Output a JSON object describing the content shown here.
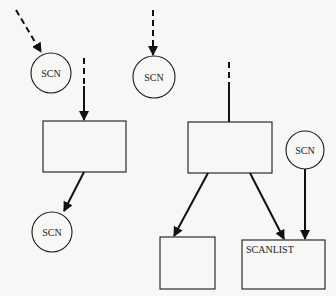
{
  "diagram": {
    "nodes": [
      {
        "id": "scn1",
        "type": "circle",
        "label": "SCN",
        "cx": 51,
        "cy": 73,
        "r": 20
      },
      {
        "id": "scn2",
        "type": "circle",
        "label": "SCN",
        "cx": 154,
        "cy": 77,
        "r": 21
      },
      {
        "id": "box1",
        "type": "rect",
        "label": "",
        "x": 43,
        "y": 121,
        "w": 83,
        "h": 51
      },
      {
        "id": "scn4",
        "type": "circle",
        "label": "SCN",
        "cx": 52,
        "cy": 232,
        "r": 20
      },
      {
        "id": "box2",
        "type": "rect",
        "label": "",
        "x": 188,
        "y": 122,
        "w": 84,
        "h": 51
      },
      {
        "id": "scn3",
        "type": "circle",
        "label": "SCN",
        "cx": 305,
        "cy": 150,
        "r": 19
      },
      {
        "id": "box3",
        "type": "rect",
        "label": "",
        "x": 160,
        "y": 237,
        "w": 55,
        "h": 52
      },
      {
        "id": "scanlist",
        "type": "rect",
        "label": "SCANLIST",
        "x": 242,
        "y": 240,
        "w": 83,
        "h": 49
      }
    ],
    "edges": [
      {
        "from": "external",
        "to": "scn1",
        "style": "dashed",
        "arrow": true
      },
      {
        "from": "external",
        "to": "scn2",
        "style": "dashed",
        "arrow": true
      },
      {
        "from": "external",
        "to": "box1",
        "style": "dashed-then-solid",
        "arrow": true
      },
      {
        "from": "box1",
        "to": "scn4",
        "style": "solid",
        "arrow": true
      },
      {
        "from": "external",
        "to": "box2",
        "style": "dashed-then-solid",
        "arrow": false
      },
      {
        "from": "box2",
        "to": "box3",
        "style": "solid",
        "arrow": true
      },
      {
        "from": "box2",
        "to": "scanlist",
        "style": "solid",
        "arrow": true
      },
      {
        "from": "scn3",
        "to": "scanlist",
        "style": "solid",
        "arrow": true
      }
    ]
  },
  "labels": {
    "scn1": "SCN",
    "scn2": "SCN",
    "scn3": "SCN",
    "scn4": "SCN",
    "scanlist": "SCANLIST"
  }
}
